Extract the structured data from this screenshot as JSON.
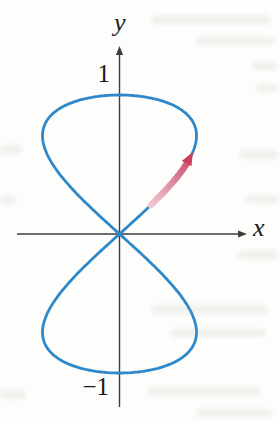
{
  "figure": {
    "colors": {
      "curve": "#2f88c9",
      "axis": "#3d3d3d",
      "arrow_start": "#eec9d4",
      "arrow_end": "#c9405e",
      "label_text": "#1b1b1b",
      "background": "#fdfdfb"
    }
  },
  "chart_data": {
    "type": "line",
    "subtype": "parametric-curve",
    "title": "",
    "equations": {
      "x": "sin(2t)",
      "y": "sin(t)"
    },
    "t_range": [
      0,
      6.2832
    ],
    "xlabel": "x",
    "ylabel": "y",
    "x_ticks": [],
    "y_ticks": [
      {
        "value": 1,
        "label": "1"
      },
      {
        "value": -1,
        "label": "−1"
      }
    ],
    "xlim": [
      -1.33,
      1.66
    ],
    "ylim": [
      -1.25,
      1.36
    ],
    "grid": false,
    "key_points": [
      [
        0,
        0
      ],
      [
        1,
        0.71
      ],
      [
        0,
        1
      ],
      [
        -1,
        0.71
      ],
      [
        0,
        0
      ],
      [
        1,
        -0.71
      ],
      [
        0,
        -1
      ],
      [
        -1,
        -0.71
      ],
      [
        0,
        0
      ]
    ],
    "direction_arrow": {
      "t_start": 0.21,
      "t_shaft_end": 0.52,
      "t_tip": 0.63,
      "meaning": "direction of increasing t"
    },
    "plot_mapping": {
      "origin_px": [
        119.5,
        234
      ],
      "x_unit_px": 77,
      "y_unit_px": 139,
      "x_axis_px": {
        "x1": 17,
        "x2": 247,
        "y": 234
      },
      "y_axis_px": {
        "y1": 407,
        "y2": 46,
        "x": 119.5
      }
    }
  }
}
